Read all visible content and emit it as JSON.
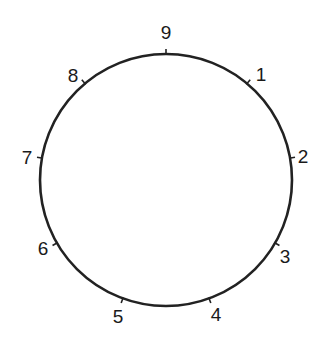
{
  "diagram": {
    "type": "circle-with-numbered-points",
    "center": [
      166,
      180
    ],
    "radius": 126,
    "stroke_color": "#222222",
    "points": [
      {
        "label": "9",
        "angle_deg": 0,
        "lx": 166,
        "ly": 39
      },
      {
        "label": "1",
        "angle_deg": 40,
        "lx": 261,
        "ly": 81
      },
      {
        "label": "2",
        "angle_deg": 80,
        "lx": 303,
        "ly": 163
      },
      {
        "label": "3",
        "angle_deg": 120,
        "lx": 285,
        "ly": 263
      },
      {
        "label": "4",
        "angle_deg": 160,
        "lx": 216,
        "ly": 321
      },
      {
        "label": "5",
        "angle_deg": 200,
        "lx": 118,
        "ly": 323
      },
      {
        "label": "6",
        "angle_deg": 240,
        "lx": 43,
        "ly": 255
      },
      {
        "label": "7",
        "angle_deg": 280,
        "lx": 27,
        "ly": 164
      },
      {
        "label": "8",
        "angle_deg": 320,
        "lx": 73,
        "ly": 82
      }
    ]
  }
}
